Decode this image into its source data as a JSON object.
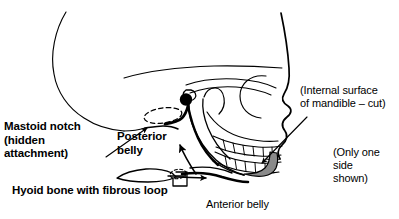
{
  "figure": {
    "background_color": "#ffffff",
    "ink_color": "#000000",
    "cut_surface_color": "#8a8a8a"
  },
  "labels": {
    "mastoid_notch": "Mastoid notch\n(hidden\nattachment)",
    "posterior_belly": "Posterior\nbelly",
    "hyoid_loop": "Hyoid bone with fibrous loop",
    "internal_surface": "(Internal surface\nof mandible – cut)",
    "only_one_side": "(Only one\nside\nshown)",
    "anterior_belly": "Anterior belly"
  },
  "structures": [
    {
      "name": "cranial-vault",
      "label": "Cranial vault outline"
    },
    {
      "name": "mastoid-process",
      "label": "Mastoid process"
    },
    {
      "name": "mastoid-notch-attachment",
      "label": "Hidden digastric attachment (dashed ellipse)"
    },
    {
      "name": "styloid-origin-marker",
      "label": "Filled origin marker"
    },
    {
      "name": "zygomatic-arch",
      "label": "Zygomatic arch"
    },
    {
      "name": "orbit",
      "label": "Orbital rim"
    },
    {
      "name": "nasal-profile",
      "label": "Nasal and facial profile"
    },
    {
      "name": "maxillary-teeth",
      "label": "Upper teeth row"
    },
    {
      "name": "mandibular-teeth",
      "label": "Lower teeth row"
    },
    {
      "name": "mandible-ramus",
      "label": "Mandibular ramus"
    },
    {
      "name": "mandible-cut-surface",
      "label": "Internal surface of mandible, cut"
    },
    {
      "name": "posterior-belly-muscle",
      "label": "Posterior belly of digastric"
    },
    {
      "name": "anterior-belly-muscle",
      "label": "Anterior belly of digastric"
    },
    {
      "name": "hyoid-bone",
      "label": "Hyoid bone"
    },
    {
      "name": "fibrous-loop",
      "label": "Fibrous loop (dashed)"
    }
  ],
  "leader_lines": [
    {
      "name": "leader-mastoid-notch",
      "from": "Mastoid notch label",
      "to": "mastoid notch"
    },
    {
      "name": "leader-internal-surface",
      "from": "(Internal surface of mandible – cut) label",
      "to": "cut mandible surface"
    },
    {
      "name": "leader-posterior-belly-arrow",
      "from": "hyoid region",
      "to": "posterior belly"
    },
    {
      "name": "leader-anterior-belly-arrow",
      "from": "fibrous loop",
      "to": "anterior belly"
    }
  ]
}
